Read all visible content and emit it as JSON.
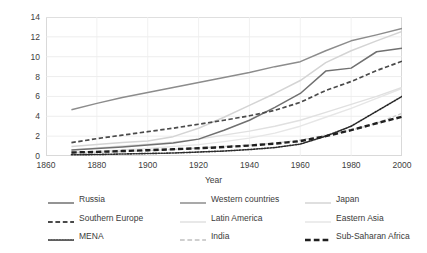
{
  "chart_data": {
    "type": "line",
    "title": "",
    "xlabel": "Year",
    "ylabel": "Average years of schooling",
    "xlim": [
      1860,
      2000
    ],
    "ylim": [
      0,
      14
    ],
    "grid": true,
    "legend_position": "bottom",
    "xticks": [
      "1860",
      "1880",
      "1900",
      "1920",
      "1940",
      "1960",
      "1980",
      "2000"
    ],
    "yticks": [
      "0",
      "2",
      "4",
      "6",
      "8",
      "10",
      "12",
      "14"
    ],
    "x": [
      1870,
      1880,
      1890,
      1900,
      1910,
      1920,
      1930,
      1940,
      1950,
      1960,
      1970,
      1980,
      1990,
      2000
    ],
    "series": [
      {
        "name": "Western countries",
        "style": "solid",
        "color": "#8c8c8c",
        "width": 1.5,
        "values": [
          4.65,
          5.3,
          5.9,
          6.4,
          6.9,
          7.4,
          7.9,
          8.4,
          9.0,
          9.5,
          10.6,
          11.6,
          12.2,
          12.85
        ]
      },
      {
        "name": "Russia",
        "style": "solid",
        "color": "#707070",
        "width": 1.5,
        "values": [
          0.6,
          0.75,
          0.9,
          1.1,
          1.3,
          1.7,
          2.6,
          3.6,
          4.9,
          6.3,
          8.55,
          8.85,
          10.5,
          10.85
        ]
      },
      {
        "name": "Japan",
        "style": "solid",
        "color": "#d4d4d4",
        "width": 1.5,
        "values": [
          0.95,
          1.15,
          1.35,
          1.5,
          1.95,
          2.8,
          3.9,
          5.1,
          6.3,
          7.6,
          9.4,
          10.6,
          11.6,
          12.55
        ]
      },
      {
        "name": "Southern Europe",
        "style": "dashed",
        "color": "#4a4a4a",
        "width": 1.7,
        "values": [
          1.35,
          1.75,
          2.1,
          2.45,
          2.8,
          3.2,
          3.6,
          4.05,
          4.6,
          5.4,
          6.6,
          7.5,
          8.6,
          9.55
        ]
      },
      {
        "name": "Latin America",
        "style": "solid",
        "color": "#e0e0e0",
        "width": 1.4,
        "values": [
          0.6,
          0.8,
          1.0,
          1.2,
          1.4,
          1.7,
          2.1,
          2.5,
          3.0,
          3.6,
          4.4,
          5.2,
          6.0,
          6.9
        ]
      },
      {
        "name": "Eastern Asia",
        "style": "solid",
        "color": "#e6e6e6",
        "width": 1.4,
        "values": [
          0.35,
          0.45,
          0.6,
          0.75,
          0.95,
          1.15,
          1.45,
          1.8,
          2.3,
          3.0,
          3.9,
          4.8,
          5.8,
          6.8
        ]
      },
      {
        "name": "MENA",
        "style": "dotted",
        "color": "#2b2b2b",
        "width": 1.6,
        "values": [
          0.12,
          0.15,
          0.2,
          0.25,
          0.3,
          0.4,
          0.5,
          0.65,
          0.85,
          1.2,
          2.0,
          3.0,
          4.5,
          6.0
        ]
      },
      {
        "name": "India",
        "style": "dashed",
        "color": "#cfcfcf",
        "width": 1.4,
        "values": [
          0.3,
          0.35,
          0.45,
          0.55,
          0.65,
          0.8,
          0.95,
          1.1,
          1.3,
          1.6,
          2.1,
          2.6,
          3.3,
          4.3
        ]
      },
      {
        "name": "Sub-Saharan Africa",
        "style": "dashed-thick",
        "color": "#1f1f1f",
        "width": 2.4,
        "values": [
          0.35,
          0.42,
          0.5,
          0.58,
          0.68,
          0.78,
          0.9,
          1.05,
          1.25,
          1.5,
          2.0,
          2.6,
          3.3,
          3.95
        ]
      }
    ]
  },
  "axes": {
    "ylabel": "Average years of schooling",
    "xlabel": "Year",
    "yticks": [
      "14",
      "12",
      "10",
      "8",
      "6",
      "4",
      "2",
      "0"
    ],
    "xticks": [
      "1860",
      "1880",
      "1900",
      "1920",
      "1940",
      "1960",
      "1980",
      "2000"
    ]
  },
  "legend": {
    "rows": [
      [
        {
          "label": "Russia",
          "style": "solid",
          "color": "#707070"
        },
        {
          "label": "Western countries",
          "style": "solid",
          "color": "#8c8c8c"
        },
        {
          "label": "Japan",
          "style": "solid",
          "color": "#d4d4d4"
        }
      ],
      [
        {
          "label": "Southern Europe",
          "style": "dashed",
          "color": "#4a4a4a"
        },
        {
          "label": "Latin America",
          "style": "solid",
          "color": "#e0e0e0"
        },
        {
          "label": "Eastern Asia",
          "style": "solid",
          "color": "#e6e6e6"
        }
      ],
      [
        {
          "label": "MENA",
          "style": "dotted",
          "color": "#2b2b2b"
        },
        {
          "label": "India",
          "style": "dashed",
          "color": "#cfcfcf"
        },
        {
          "label": "Sub-Saharan Africa",
          "style": "dashed-thick",
          "color": "#1f1f1f"
        }
      ]
    ]
  }
}
